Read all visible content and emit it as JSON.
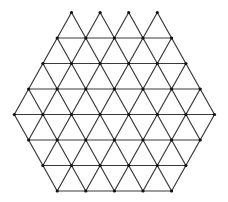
{
  "diagram": {
    "type": "triangular-lattice",
    "spacing": 28.6,
    "colors": {
      "edge": "#3a3a3a",
      "node": "#111111",
      "background": "#ffffff"
    },
    "node_radius": 1.6,
    "rows": [
      {
        "y": 12.5,
        "start_x": 71.5,
        "count": 4,
        "horizontal_edges": false
      },
      {
        "y": 38.0,
        "start_x": 57.2,
        "count": 5,
        "horizontal_edges": true
      },
      {
        "y": 63.5,
        "start_x": 42.9,
        "count": 6,
        "horizontal_edges": true
      },
      {
        "y": 89.0,
        "start_x": 28.6,
        "count": 7,
        "horizontal_edges": true
      },
      {
        "y": 114.5,
        "start_x": 14.3,
        "count": 8,
        "horizontal_edges": true
      },
      {
        "y": 140.0,
        "start_x": 28.6,
        "count": 7,
        "horizontal_edges": true
      },
      {
        "y": 165.5,
        "start_x": 42.9,
        "count": 6,
        "horizontal_edges": true
      },
      {
        "y": 191.0,
        "start_x": 57.2,
        "count": 5,
        "horizontal_edges": true
      }
    ]
  }
}
